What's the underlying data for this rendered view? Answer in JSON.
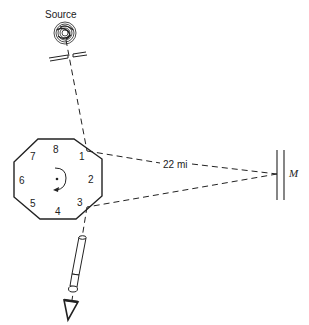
{
  "diagram": {
    "source_label": "Source",
    "distance_label": "22 mi",
    "mirror_label": "M",
    "octagon_face_labels": [
      "1",
      "2",
      "3",
      "4",
      "5",
      "6",
      "7",
      "8"
    ],
    "rotation": "clockwise",
    "components": [
      "source",
      "slit",
      "rotating-octagonal-mirror",
      "distant-mirror",
      "telescope",
      "eye"
    ],
    "colors": {
      "ink": "#222222",
      "background": "#ffffff"
    }
  }
}
